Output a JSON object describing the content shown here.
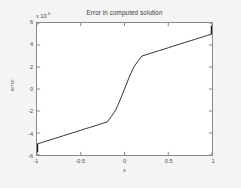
{
  "chart_data": {
    "type": "line",
    "title": "Error in computed solution",
    "xlabel": "x",
    "ylabel": "error",
    "y_exponent_prefix": "x 10",
    "y_exponent_power": "-6",
    "y_scale_factor": 1e-06,
    "xlim": [
      -1,
      1
    ],
    "ylim": [
      -6,
      6
    ],
    "xticks": [
      -1,
      -0.5,
      0,
      0.5,
      1
    ],
    "xtick_labels": [
      "-1",
      "-0.5",
      "0",
      "0.5",
      "1"
    ],
    "yticks": [
      6,
      4,
      2,
      0,
      -2,
      -4,
      -6
    ],
    "ytick_labels": [
      "6",
      "4",
      "2",
      "0",
      "-2",
      "-4",
      "-6"
    ],
    "grid": false,
    "legend": null,
    "line_color": "#1a1a1a",
    "line_width": 0.9,
    "series": [
      {
        "name": "error",
        "x": [
          -1.0,
          -0.95,
          -0.9,
          -0.85,
          -0.8,
          -0.75,
          -0.7,
          -0.65,
          -0.6,
          -0.55,
          -0.5,
          -0.45,
          -0.4,
          -0.35,
          -0.3,
          -0.25,
          -0.2,
          -0.15,
          -0.1,
          -0.05,
          0.0,
          0.05,
          0.1,
          0.15,
          0.2,
          0.25,
          0.3,
          0.35,
          0.4,
          0.45,
          0.5,
          0.55,
          0.6,
          0.65,
          0.7,
          0.75,
          0.8,
          0.85,
          0.9,
          0.95,
          1.0
        ],
        "y": [
          -5.0,
          -4.88,
          -4.75,
          -4.63,
          -4.5,
          -4.38,
          -4.25,
          -4.13,
          -4.0,
          -3.88,
          -3.75,
          -3.62,
          -3.5,
          -3.38,
          -3.25,
          -3.12,
          -3.0,
          -2.5,
          -1.9,
          -1.0,
          0.0,
          1.0,
          1.9,
          2.5,
          3.0,
          3.12,
          3.25,
          3.38,
          3.5,
          3.62,
          3.75,
          3.88,
          4.0,
          4.13,
          4.25,
          4.38,
          4.5,
          4.63,
          4.75,
          4.88,
          5.0
        ]
      }
    ],
    "endpoint_spikes": [
      {
        "x": -1.0,
        "y_from": -5.0,
        "y_to": -5.75
      },
      {
        "x": 1.0,
        "y_from": 5.0,
        "y_to": 5.75
      }
    ]
  }
}
